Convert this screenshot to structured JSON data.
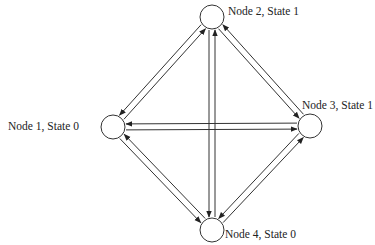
{
  "diagram": {
    "type": "state-transition-graph",
    "colors": {
      "stroke": "#333333",
      "background": "#ffffff",
      "text": "#222222"
    },
    "nodes": [
      {
        "id": "node1",
        "label": "Node 1, State 0",
        "cx": 113,
        "cy": 127,
        "r": 12,
        "label_x": 8,
        "label_y": 121
      },
      {
        "id": "node2",
        "label": "Node 2, State 1",
        "cx": 212,
        "cy": 17,
        "r": 12,
        "label_x": 228,
        "label_y": 6
      },
      {
        "id": "node3",
        "label": "Node 3, State 1",
        "cx": 310,
        "cy": 126,
        "r": 12,
        "label_x": 302,
        "label_y": 100
      },
      {
        "id": "node4",
        "label": "Node 4, State 0",
        "cx": 212,
        "cy": 230,
        "r": 12,
        "label_x": 225,
        "label_y": 229
      }
    ],
    "edges": [
      {
        "from": "node2",
        "to": "node1"
      },
      {
        "from": "node1",
        "to": "node2"
      },
      {
        "from": "node3",
        "to": "node2"
      },
      {
        "from": "node2",
        "to": "node3"
      },
      {
        "from": "node1",
        "to": "node3"
      },
      {
        "from": "node3",
        "to": "node1"
      },
      {
        "from": "node4",
        "to": "node2"
      },
      {
        "from": "node2",
        "to": "node4"
      },
      {
        "from": "node4",
        "to": "node1"
      },
      {
        "from": "node1",
        "to": "node4"
      },
      {
        "from": "node4",
        "to": "node3"
      },
      {
        "from": "node3",
        "to": "node4"
      }
    ]
  }
}
